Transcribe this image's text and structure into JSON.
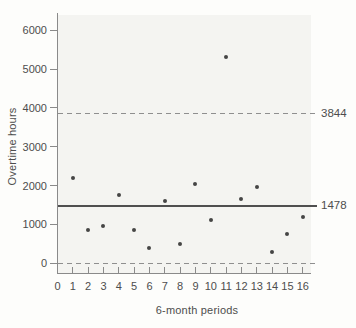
{
  "chart_data": {
    "type": "scatter",
    "title": "",
    "xlabel": "6-month periods",
    "ylabel": "Overtime hours",
    "x": [
      1,
      2,
      3,
      4,
      5,
      6,
      7,
      8,
      9,
      10,
      11,
      12,
      13,
      14,
      15,
      16
    ],
    "values": [
      2200,
      850,
      950,
      1750,
      850,
      400,
      1600,
      500,
      2050,
      1125,
      5300,
      1650,
      1950,
      300,
      750,
      1200
    ],
    "x_ticks": [
      0,
      1,
      2,
      3,
      4,
      5,
      6,
      7,
      8,
      9,
      10,
      11,
      12,
      13,
      14,
      15,
      16
    ],
    "y_ticks": [
      0,
      1000,
      2000,
      3000,
      4000,
      5000,
      6000
    ],
    "xlim": [
      0,
      16.6
    ],
    "ylim": [
      -270,
      6440
    ],
    "grid": false,
    "legend": null,
    "reference_lines": [
      {
        "value": 3844,
        "label": "3844",
        "style": "dashed"
      },
      {
        "value": 1478,
        "label": "1478",
        "style": "solid"
      },
      {
        "value": 0,
        "label": "",
        "style": "dashed"
      }
    ],
    "colors": {
      "point": "#454545",
      "axis": "#8a8a8a",
      "solid_line": "#4f4f4f",
      "dashed_line": "#8f8f8f",
      "text": "#4d4d4d",
      "plot_background": "#f4f4f1",
      "page_background": "#fdfdfb"
    }
  }
}
